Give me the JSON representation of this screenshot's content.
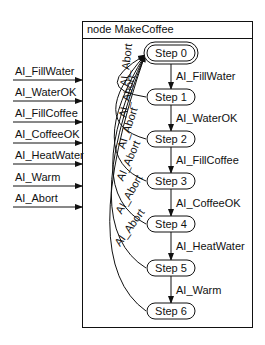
{
  "node": {
    "title": "node MakeCoffee"
  },
  "inputs": [
    {
      "label": "AI_FillWater",
      "y": 80
    },
    {
      "label": "AI_WaterOK",
      "y": 101
    },
    {
      "label": "AI_FillCoffee",
      "y": 122
    },
    {
      "label": "AI_CoffeeOK",
      "y": 143
    },
    {
      "label": "AI_HeatWater",
      "y": 164
    },
    {
      "label": "AI_Warm",
      "y": 186
    },
    {
      "label": "AI_Abort",
      "y": 207
    }
  ],
  "steps": [
    {
      "label": "Step 0",
      "cy": 53,
      "initial": true
    },
    {
      "label": "Step 1",
      "cy": 97
    },
    {
      "label": "Step 2",
      "cy": 139
    },
    {
      "label": "Step 3",
      "cy": 181
    },
    {
      "label": "Step 4",
      "cy": 224
    },
    {
      "label": "Step 5",
      "cy": 268
    },
    {
      "label": "Step 6",
      "cy": 311
    }
  ],
  "transitions": [
    {
      "label": "AI_FillWater"
    },
    {
      "label": "AI_WaterOK"
    },
    {
      "label": "AI_FillCoffee"
    },
    {
      "label": "AI_CoffeeOK"
    },
    {
      "label": "AI_HeatWater"
    },
    {
      "label": "AI_Warm"
    }
  ],
  "abort_label": "AI_Abort"
}
